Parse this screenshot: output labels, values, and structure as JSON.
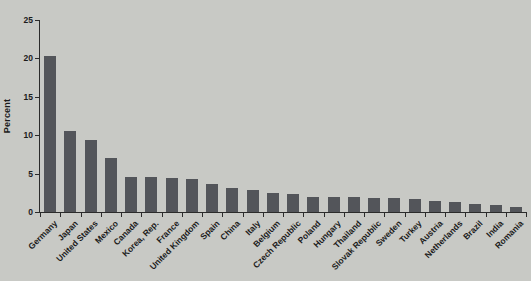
{
  "chart_data": {
    "type": "bar",
    "title": "",
    "xlabel": "",
    "ylabel": "Percent",
    "ylim": [
      0,
      25
    ],
    "yticks": [
      0,
      5,
      10,
      15,
      20,
      25
    ],
    "grid": false,
    "legend": null,
    "bar_color": "#53555a",
    "background_color": "#c8c9c5",
    "axis_color": "#2b2b2b",
    "text_color": "#1b1b1b",
    "categories": [
      "Germany",
      "Japan",
      "United States",
      "Mexico",
      "Canada",
      "Korea, Rep.",
      "France",
      "United Kingdom",
      "Spain",
      "China",
      "Italy",
      "Belgium",
      "Czech Republic",
      "Poland",
      "Hungary",
      "Thailand",
      "Slovak Republic",
      "Sweden",
      "Turkey",
      "Austria",
      "Netherlands",
      "Brazil",
      "India",
      "Romania"
    ],
    "values": [
      20.3,
      10.5,
      9.4,
      7.0,
      4.6,
      4.5,
      4.4,
      4.3,
      3.7,
      3.1,
      2.8,
      2.5,
      2.4,
      2.0,
      1.9,
      1.9,
      1.8,
      1.8,
      1.7,
      1.4,
      1.3,
      1.0,
      0.9,
      0.7
    ]
  }
}
